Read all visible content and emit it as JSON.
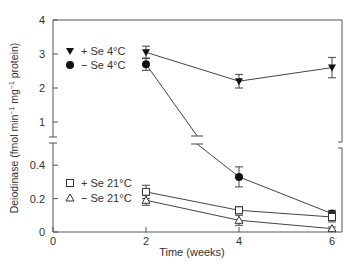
{
  "chart_data": {
    "type": "line",
    "title": "",
    "xlabel": "Time (weeks)",
    "ylabel": "Deiodinase (fmol min⁻¹ mg⁻¹ protein)",
    "ylabel_parts": [
      "Deiodinase (fmol min",
      "−1",
      " mg",
      "−1",
      " protein)"
    ],
    "x_ticks": [
      0,
      2,
      4,
      6
    ],
    "xlim": [
      0,
      6
    ],
    "y_axis_broken": true,
    "y_segments": [
      {
        "range": [
          0,
          0.55
        ],
        "ticks": [
          0,
          0.2,
          0.4
        ],
        "tick_labels": [
          "0",
          "0.2",
          "0.4"
        ]
      },
      {
        "range": [
          0.7,
          4
        ],
        "ticks": [
          1,
          2,
          3,
          4
        ],
        "tick_labels": [
          "1",
          "2",
          "3",
          "4"
        ]
      }
    ],
    "grid": false,
    "x": [
      2,
      4,
      6
    ],
    "series": [
      {
        "name": "+ Se 4°C",
        "marker": "triangle-down-filled",
        "values": [
          3.05,
          2.2,
          2.6
        ],
        "errors": [
          0.18,
          0.2,
          0.3
        ]
      },
      {
        "name": "− Se 4°C",
        "marker": "circle-filled",
        "values": [
          2.7,
          0.33,
          0.11
        ],
        "errors": [
          0.18,
          0.06,
          0.02
        ]
      },
      {
        "name": "+ Se 21°C",
        "marker": "square-open",
        "values": [
          0.24,
          0.13,
          0.09
        ],
        "errors": [
          0.04,
          0.02,
          0.03
        ]
      },
      {
        "name": "− Se 21°C",
        "marker": "triangle-up-open",
        "values": [
          0.19,
          0.07,
          0.02
        ],
        "errors": [
          0.03,
          0.03,
          0.01
        ]
      }
    ],
    "legends": [
      {
        "position": "upper-left",
        "entries": [
          "+ Se 4°C",
          "− Se 4°C"
        ]
      },
      {
        "position": "lower-left",
        "entries": [
          "+ Se 21°C",
          "− Se 21°C"
        ]
      }
    ]
  }
}
